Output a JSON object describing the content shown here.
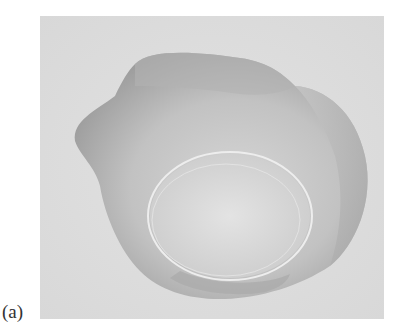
{
  "figure": {
    "panel_label": "(a)",
    "photo": {
      "subject": "translucent shell-like bowl object",
      "background_color": "#dcdcdc",
      "object_color": "#b8b8b8",
      "rim_color": "#ebebeb"
    }
  }
}
